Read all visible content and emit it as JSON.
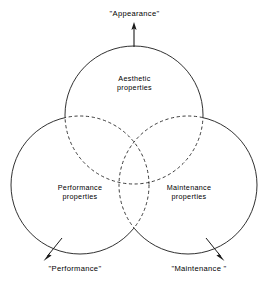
{
  "figure": {
    "type": "venn-diagram",
    "stroke_color": "#1a1a1a",
    "background_color": "#ffffff",
    "text_color": "#000000"
  },
  "sets": [
    {
      "id": "aesthetic",
      "position": "top",
      "inner_label_line1": "Aesthetic",
      "inner_label_line2": "properties",
      "outer_label": "\"Appearance\"",
      "center_x": 134,
      "center_y": 115,
      "radius": 69
    },
    {
      "id": "performance",
      "position": "bottom-left",
      "inner_label_line1": "Performance",
      "inner_label_line2": "properties",
      "outer_label": "\"Performance\"",
      "center_x": 80,
      "center_y": 185,
      "radius": 69
    },
    {
      "id": "maintenance",
      "position": "bottom-right",
      "inner_label_line1": "Maintenance",
      "inner_label_line2": "properties",
      "outer_label": "\"Maintenance \"",
      "center_x": 188,
      "center_y": 185,
      "radius": 69
    }
  ],
  "connectors": [
    {
      "id": "appearance-arrow",
      "direction": "up",
      "from_x": 134,
      "from_y": 46,
      "to_x": 134,
      "to_y": 24
    },
    {
      "id": "performance-arrow",
      "direction": "down-left",
      "from_x": 62,
      "from_y": 238,
      "to_x": 44,
      "to_y": 260
    },
    {
      "id": "maintenance-arrow",
      "direction": "down-right",
      "from_x": 206,
      "from_y": 238,
      "to_x": 224,
      "to_y": 260
    }
  ],
  "style": {
    "solid_arc_note": "outer boundary arcs",
    "dashed_arc_note": "arcs interior to another circle"
  }
}
